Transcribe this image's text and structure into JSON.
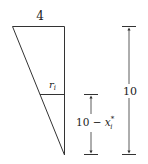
{
  "diagram": {
    "top_width_label": "4",
    "radius_label_main": "r",
    "radius_label_sub": "i",
    "slice_height_label_prefix": "10 − ",
    "slice_height_label_var": "x",
    "slice_height_label_sub": "i",
    "slice_height_label_sup": "*",
    "total_height_label": "10",
    "colors": {
      "stroke": "#333333",
      "text": "#222222",
      "background": "#ffffff"
    }
  }
}
